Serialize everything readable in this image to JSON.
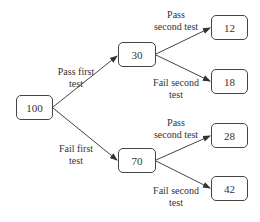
{
  "diagram": {
    "type": "probability-tree",
    "nodes": {
      "root": {
        "value": "100"
      },
      "pass_first": {
        "value": "30"
      },
      "fail_first": {
        "value": "70"
      },
      "pass_first_pass_second": {
        "value": "12"
      },
      "pass_first_fail_second": {
        "value": "18"
      },
      "fail_first_pass_second": {
        "value": "28"
      },
      "fail_first_fail_second": {
        "value": "42"
      }
    },
    "edge_labels": {
      "pass_first": {
        "line1": "Pass first",
        "line2": "test"
      },
      "fail_first": {
        "line1": "Fail first",
        "line2": "test"
      },
      "upper_pass_second": {
        "line1": "Pass",
        "line2": "second test"
      },
      "upper_fail_second": {
        "line1": "Fail second",
        "line2": "test"
      },
      "lower_pass_second": {
        "line1": "Pass",
        "line2": "second test"
      },
      "lower_fail_second": {
        "line1": "Fail second",
        "line2": "test"
      }
    },
    "colors": {
      "line": "#444444",
      "text": "#333333",
      "background": "#ffffff"
    }
  }
}
